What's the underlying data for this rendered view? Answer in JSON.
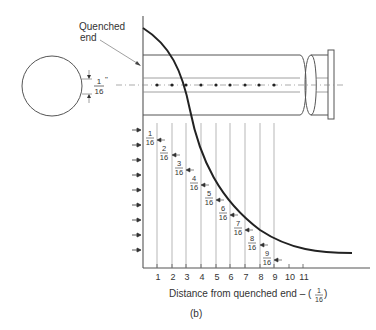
{
  "labels": {
    "quenched_end_line1": "Quenched",
    "quenched_end_line2": "end",
    "spacing_num": "1",
    "spacing_den": "16",
    "spacing_unit": "\"",
    "xlabel": "Distance from quenched end – (",
    "xlabel_num": "1",
    "xlabel_den": "16",
    "xlabel_close": ")",
    "caption": "(b)"
  },
  "fractions": [
    {
      "num": "1",
      "den": "16"
    },
    {
      "num": "2",
      "den": "16"
    },
    {
      "num": "3",
      "den": "16"
    },
    {
      "num": "4",
      "den": "16"
    },
    {
      "num": "5",
      "den": "16"
    },
    {
      "num": "6",
      "den": "16"
    },
    {
      "num": "7",
      "den": "16"
    },
    {
      "num": "8",
      "den": "16"
    },
    {
      "num": "9",
      "den": "16"
    }
  ],
  "x_ticks": [
    "1",
    "2",
    "3",
    "4",
    "5",
    "6",
    "7",
    "8",
    "9",
    "10",
    "11"
  ]
}
